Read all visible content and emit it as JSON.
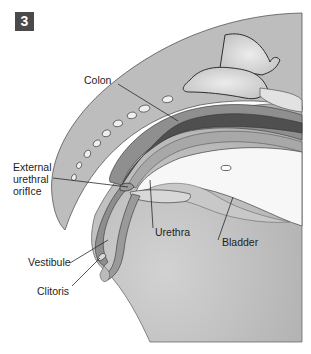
{
  "figure": {
    "panel_number": "3",
    "labels": {
      "colon": "Colon",
      "external_urethral_orifice": "External\nurethral\norifIce",
      "vestibule": "Vestibule",
      "clitoris": "Clitoris",
      "urethra": "Urethra",
      "bladder": "Bladder"
    },
    "colors": {
      "body_tissue": "#b9b9b9",
      "light_tissue": "#d6d6d6",
      "white_cavity": "#f7f7f7",
      "colon_wall": "#8c8c8c",
      "colon_lumen": "#4e4e4e",
      "outline": "#3a3a3a",
      "leader_line": "#2a2a2a",
      "badge_bg": "#4a4a4a"
    }
  }
}
